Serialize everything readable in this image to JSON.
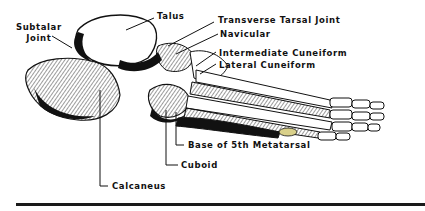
{
  "figure": {
    "labels": {
      "subtalar_joint": "Subtalar\nJoint",
      "talus": "Talus",
      "transverse_tarsal_joint": "Transverse Tarsal Joint",
      "navicular": "Navicular",
      "intermediate_cuneiform": "Intermediate Cuneiform",
      "lateral_cuneiform": "Lateral Cuneiform",
      "base_5th_metatarsal": "Base of 5th Metatarsal",
      "cuboid": "Cuboid",
      "calcaneus": "Calcaneus"
    },
    "colors": {
      "ink": "#111111",
      "paper": "#ffffff",
      "highlight": "#d9d08a"
    }
  }
}
